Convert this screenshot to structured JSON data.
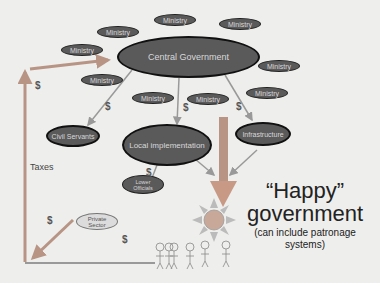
{
  "diagram": {
    "central": "Central Government",
    "ministries": [
      "Ministry",
      "Ministry",
      "Ministry",
      "Ministry",
      "Ministry",
      "Ministry",
      "Ministry",
      "Ministry",
      "Ministry"
    ],
    "nodes": {
      "civil_servants": "Civil Servants",
      "local_implementation": "Local implementation",
      "infrastructure": "Infrastructure",
      "lower_officials": "Lower Officials",
      "private_sector": "Private Sector"
    },
    "labels": {
      "taxes": "Taxes",
      "dollar": "$"
    },
    "headline": {
      "line1": "“Happy”",
      "line2": "government",
      "sub1": "(can include patronage",
      "sub2": "systems)"
    },
    "colors": {
      "background": "#eeeeec",
      "oval_fill": "#5a5a5a",
      "arrow_gray": "#999999",
      "arrow_orange": "#c89a86",
      "sun_fill": "#c8a898"
    }
  }
}
